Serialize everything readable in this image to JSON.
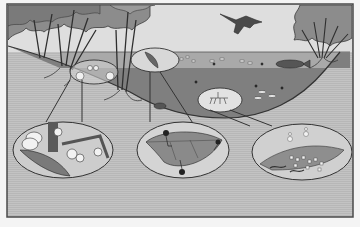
{
  "figure": {
    "title": "",
    "frame": {
      "x": 7,
      "y": 4,
      "width": 346,
      "height": 213
    },
    "colors": {
      "page": "#f4f4f4",
      "frame_border": "#4a4a4a",
      "ground": "#bdbdbd",
      "sky": "#dedede",
      "water_surface": "#a8a8a8",
      "water_deep": "#7d7d7d",
      "tree_canopy": "#8f8f8f",
      "outline": "#333333",
      "inset_fill": "#d6d6d6",
      "dark_detail": "#2a2a2a",
      "light_detail": "#f2f2f2"
    },
    "elements": [
      {
        "id": "left-trees",
        "label": "Riparian trees (left bank)"
      },
      {
        "id": "right-trees",
        "label": "Riparian trees (right bank)"
      },
      {
        "id": "bird",
        "label": "Bird of prey in flight"
      },
      {
        "id": "pond",
        "label": "Pond basin cross-section"
      },
      {
        "id": "fish",
        "label": "Large fish"
      },
      {
        "id": "zone-shore",
        "label": "Shoreline litter zone (circled)"
      },
      {
        "id": "zone-surface",
        "label": "Surface leaf zone (circled)"
      },
      {
        "id": "zone-bottom",
        "label": "Pond bottom zone (circled)"
      },
      {
        "id": "inset-1",
        "label": "Inset: fallen flowers and leaves"
      },
      {
        "id": "inset-2",
        "label": "Inset: leaf with shredder invertebrates"
      },
      {
        "id": "inset-3",
        "label": "Inset: fragmented detritus with microbes and worms"
      }
    ]
  }
}
